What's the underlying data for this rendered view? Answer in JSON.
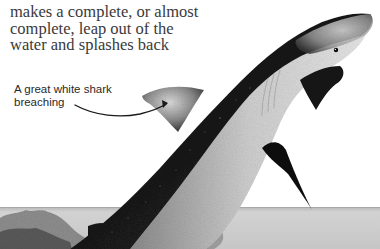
{
  "body_text": {
    "lines": [
      "makes a complete, or almost",
      "complete, leap out of the",
      "water and splashes back"
    ]
  },
  "figure": {
    "caption": {
      "lines": [
        "A great white shark",
        "breaching"
      ]
    },
    "palette": {
      "paper": "#ffffff",
      "text": "#3a3a3a",
      "shark_dark": "#141414",
      "shark_mid": "#6e6e6e",
      "shark_light": "#d8d8d8",
      "sea": "#cfcfcf",
      "sea_horizon": "#bdbdbd",
      "leader_line": "#1a1a1a"
    }
  }
}
